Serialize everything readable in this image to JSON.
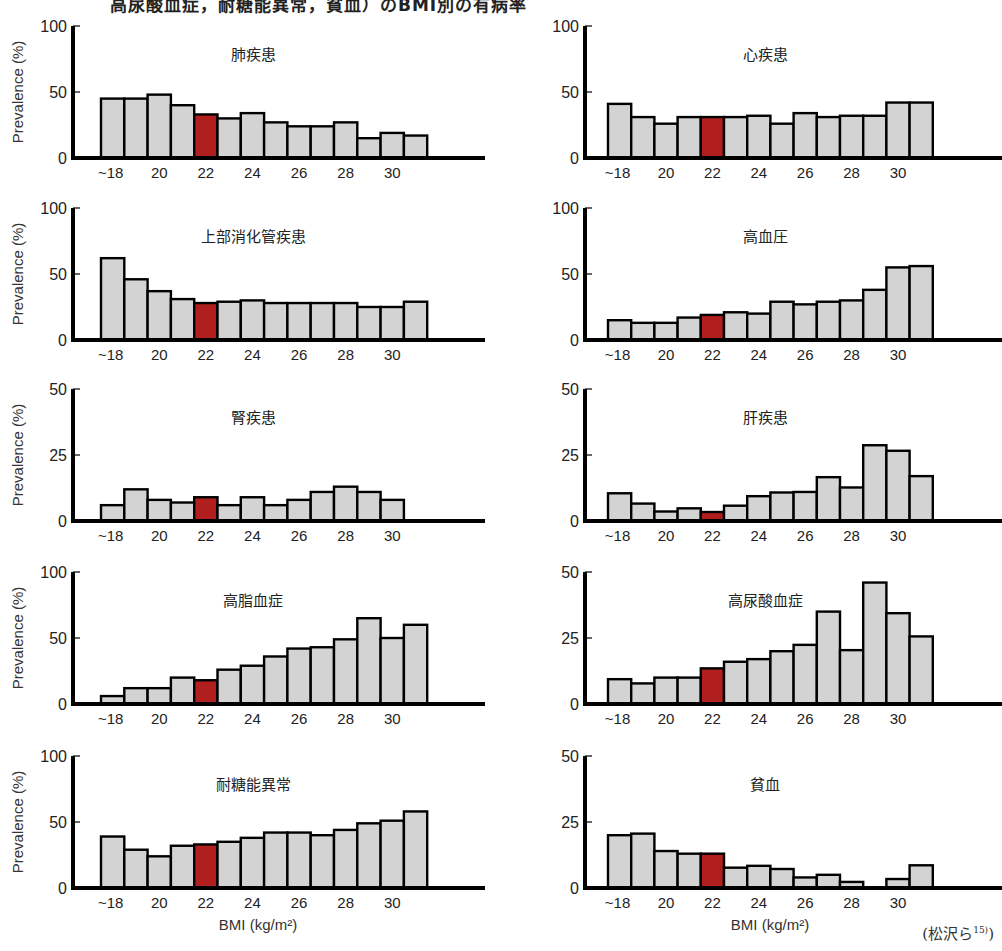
{
  "page": {
    "top_title_fragment": "高尿酸血症，耐糖能異常，貧血）のBMI別の有病率",
    "citation": "(松沢ら",
    "citation_sup": "15)",
    "citation_close": ")",
    "ylabel": "Prevalence (%)",
    "xlabel": "BMI (kg/m²)"
  },
  "style": {
    "bar_fill": "#d3d3d3",
    "highlight_fill": "#b01e1e",
    "bar_stroke": "#000000"
  },
  "chart_data": [
    {
      "type": "bar",
      "title": "肺疾患",
      "position": "row1-left",
      "categories": [
        "~18",
        "19",
        "20",
        "21",
        "22",
        "23",
        "24",
        "25",
        "26",
        "27",
        "28",
        "29",
        "30",
        "31"
      ],
      "values": [
        45,
        45,
        48,
        40,
        33,
        30,
        34,
        27,
        24,
        24,
        27,
        15,
        19,
        17
      ],
      "highlight_index": 4,
      "xticks": [
        "~18",
        "20",
        "22",
        "24",
        "26",
        "28",
        "30"
      ],
      "yticks": [
        0,
        50,
        100
      ],
      "ylim": [
        0,
        100
      ],
      "ylabel": "Prevalence (%)",
      "xlabel": ""
    },
    {
      "type": "bar",
      "title": "心疾患",
      "position": "row1-right",
      "categories": [
        "~18",
        "19",
        "20",
        "21",
        "22",
        "23",
        "24",
        "25",
        "26",
        "27",
        "28",
        "29",
        "30",
        "31"
      ],
      "values": [
        41,
        31,
        26,
        31,
        31,
        31,
        32,
        26,
        34,
        31,
        32,
        32,
        42,
        42
      ],
      "highlight_index": 4,
      "xticks": [
        "~18",
        "20",
        "22",
        "24",
        "26",
        "28",
        "30"
      ],
      "yticks": [
        0,
        50,
        100
      ],
      "ylim": [
        0,
        100
      ],
      "ylabel": "",
      "xlabel": ""
    },
    {
      "type": "bar",
      "title": "上部消化管疾患",
      "position": "row2-left",
      "categories": [
        "~18",
        "19",
        "20",
        "21",
        "22",
        "23",
        "24",
        "25",
        "26",
        "27",
        "28",
        "29",
        "30",
        "31"
      ],
      "values": [
        62,
        46,
        37,
        31,
        28,
        29,
        30,
        28,
        28,
        28,
        28,
        25,
        25,
        29
      ],
      "highlight_index": 4,
      "xticks": [
        "~18",
        "20",
        "22",
        "24",
        "26",
        "28",
        "30"
      ],
      "yticks": [
        0,
        50,
        100
      ],
      "ylim": [
        0,
        100
      ],
      "ylabel": "Prevalence (%)",
      "xlabel": ""
    },
    {
      "type": "bar",
      "title": "高血圧",
      "position": "row2-right",
      "categories": [
        "~18",
        "19",
        "20",
        "21",
        "22",
        "23",
        "24",
        "25",
        "26",
        "27",
        "28",
        "29",
        "30",
        "31"
      ],
      "values": [
        15,
        13,
        13,
        17,
        19,
        21,
        20,
        29,
        27,
        29,
        30,
        38,
        55,
        56
      ],
      "highlight_index": 4,
      "xticks": [
        "~18",
        "20",
        "22",
        "24",
        "26",
        "28",
        "30"
      ],
      "yticks": [
        0,
        50,
        100
      ],
      "ylim": [
        0,
        100
      ],
      "ylabel": "",
      "xlabel": ""
    },
    {
      "type": "bar",
      "title": "腎疾患",
      "position": "row3-left",
      "categories": [
        "~18",
        "19",
        "20",
        "21",
        "22",
        "23",
        "24",
        "25",
        "26",
        "27",
        "28",
        "29",
        "30"
      ],
      "values": [
        6,
        12,
        8,
        7,
        9,
        6,
        9,
        6,
        8,
        11,
        13,
        11,
        8
      ],
      "highlight_index": 4,
      "xticks": [
        "~18",
        "20",
        "22",
        "24",
        "26",
        "28",
        "30"
      ],
      "yticks": [
        0,
        25,
        50
      ],
      "ylim": [
        0,
        50
      ],
      "ylabel": "Prevalence (%)",
      "xlabel": ""
    },
    {
      "type": "bar",
      "title": "肝疾患",
      "position": "row3-right",
      "categories": [
        "~18",
        "19",
        "20",
        "21",
        "22",
        "23",
        "24",
        "25",
        "26",
        "27",
        "28",
        "29",
        "30",
        "31"
      ],
      "values": [
        10.5,
        6.6,
        3.6,
        4.8,
        3.4,
        5.8,
        9.4,
        10.8,
        11,
        16.6,
        12.7,
        28.7,
        26.6,
        17
      ],
      "highlight_index": 4,
      "xticks": [
        "~18",
        "20",
        "22",
        "24",
        "26",
        "28",
        "30"
      ],
      "yticks": [
        0,
        25,
        50
      ],
      "ylim": [
        0,
        50
      ],
      "ylabel": "",
      "xlabel": ""
    },
    {
      "type": "bar",
      "title": "高脂血症",
      "position": "row4-left",
      "categories": [
        "~18",
        "19",
        "20",
        "21",
        "22",
        "23",
        "24",
        "25",
        "26",
        "27",
        "28",
        "29",
        "30",
        "31"
      ],
      "values": [
        6,
        12,
        12,
        20,
        18,
        26,
        29,
        36,
        42,
        43,
        49,
        65,
        50,
        60
      ],
      "highlight_index": 4,
      "xticks": [
        "~18",
        "20",
        "22",
        "24",
        "26",
        "28",
        "30"
      ],
      "yticks": [
        0,
        50,
        100
      ],
      "ylim": [
        0,
        100
      ],
      "ylabel": "Prevalence (%)",
      "xlabel": ""
    },
    {
      "type": "bar",
      "title": "高尿酸血症",
      "position": "row4-right",
      "categories": [
        "~18",
        "19",
        "20",
        "21",
        "22",
        "23",
        "24",
        "25",
        "26",
        "27",
        "28",
        "29",
        "30",
        "31"
      ],
      "values": [
        9.4,
        7.8,
        10,
        10,
        13.5,
        16,
        17,
        20,
        22.4,
        35,
        20.4,
        46,
        34.4,
        25.6
      ],
      "highlight_index": 4,
      "xticks": [
        "~18",
        "20",
        "22",
        "24",
        "26",
        "28",
        "30"
      ],
      "yticks": [
        0,
        25,
        50
      ],
      "ylim": [
        0,
        50
      ],
      "ylabel": "",
      "xlabel": ""
    },
    {
      "type": "bar",
      "title": "耐糖能異常",
      "position": "row5-left",
      "categories": [
        "~18",
        "19",
        "20",
        "21",
        "22",
        "23",
        "24",
        "25",
        "26",
        "27",
        "28",
        "29",
        "30",
        "31"
      ],
      "values": [
        39,
        29,
        24,
        32,
        33,
        35,
        38,
        42,
        42,
        40,
        44,
        49,
        51,
        58
      ],
      "highlight_index": 4,
      "xticks": [
        "~18",
        "20",
        "22",
        "24",
        "26",
        "28",
        "30"
      ],
      "yticks": [
        0,
        50,
        100
      ],
      "ylim": [
        0,
        100
      ],
      "ylabel": "Prevalence (%)",
      "xlabel": "BMI (kg/m²)"
    },
    {
      "type": "bar",
      "title": "貧血",
      "position": "row5-right",
      "categories": [
        "~18",
        "19",
        "20",
        "21",
        "22",
        "23",
        "24",
        "25",
        "26",
        "27",
        "28",
        "29",
        "30",
        "31"
      ],
      "values": [
        20,
        20.6,
        14,
        13,
        13,
        7.7,
        8.4,
        7.2,
        4,
        5,
        2.3,
        0,
        3.4,
        8.6
      ],
      "highlight_index": 4,
      "xticks": [
        "~18",
        "20",
        "22",
        "24",
        "26",
        "28",
        "30"
      ],
      "yticks": [
        0,
        25,
        50
      ],
      "ylim": [
        0,
        50
      ],
      "ylabel": "",
      "xlabel": "BMI (kg/m²)"
    }
  ]
}
